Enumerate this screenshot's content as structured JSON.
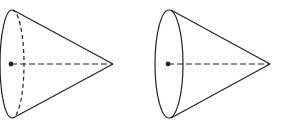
{
  "figure": {
    "stroke_color": "#222222",
    "background": "#ffffff",
    "cones": [
      {
        "label": "cone-left",
        "base_center": [
          11,
          64
        ],
        "base_rx": 12,
        "base_ry": 54,
        "apex": [
          113,
          64
        ],
        "hidden_base_edge": "dashed"
      },
      {
        "label": "cone-right",
        "base_center": [
          169,
          64
        ],
        "base_rx": 14,
        "base_ry": 54,
        "apex": [
          270,
          64
        ],
        "hidden_base_edge": "solid"
      }
    ]
  }
}
